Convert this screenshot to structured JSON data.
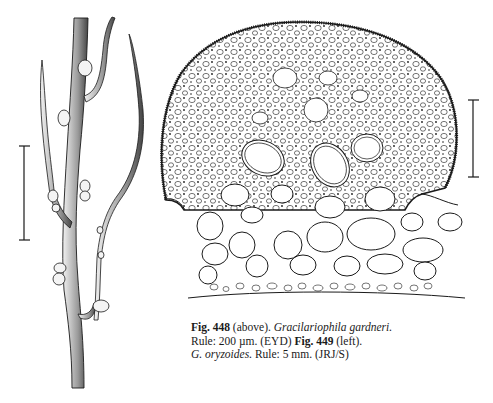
{
  "figure_449": {
    "label": "Fig. 449",
    "species": "G. oryzoides",
    "scale_bar": "5 mm",
    "credit": "(JRJ/S)"
  },
  "figure_448": {
    "label": "Fig. 448",
    "species": "Gracilariophila gardneri",
    "scale_bar": "200 µm",
    "credit": "(EYD)"
  },
  "caption": {
    "line1": {
      "fig": "Fig. 448",
      "pos": " (above). ",
      "species": "Gracilariophila gardneri."
    },
    "line2": {
      "rule": "Rule: 200 µm. (EYD)  ",
      "fig": "Fig. 449",
      "pos": " (left)."
    },
    "line3": {
      "species": "G. oryzoides.",
      "rule": " Rule: 5 mm. (JRJ/S)"
    }
  },
  "colors": {
    "ink": "#1a1a1a",
    "paper": "#ffffff"
  }
}
